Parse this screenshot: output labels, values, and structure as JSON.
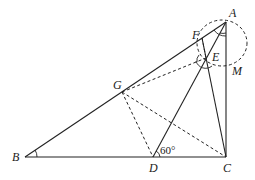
{
  "diagram": {
    "type": "geometry",
    "points": {
      "A": {
        "label": "A",
        "x": 226,
        "y": 22
      },
      "B": {
        "label": "B",
        "x": 25,
        "y": 157
      },
      "C": {
        "label": "C",
        "x": 226,
        "y": 157
      },
      "D": {
        "label": "D",
        "x": 153,
        "y": 157
      },
      "E": {
        "label": "E",
        "x": 206,
        "y": 58
      },
      "F": {
        "label": "F",
        "x": 202,
        "y": 38
      },
      "G": {
        "label": "G",
        "x": 122,
        "y": 92
      },
      "M": {
        "label": "M",
        "x": 226,
        "y": 70
      }
    },
    "angle_label": "60°",
    "solid_segments": [
      "AB",
      "BC",
      "AC",
      "AD",
      "FC",
      "DC"
    ],
    "dashed_segments": [
      "GD",
      "GC",
      "GE",
      "FE"
    ],
    "dashed_circle": {
      "cx": 222,
      "cy": 43,
      "rx": 25,
      "ry": 23
    }
  }
}
